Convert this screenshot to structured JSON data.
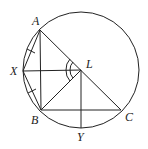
{
  "diagram": {
    "type": "geometry",
    "circle": {
      "cx": 81,
      "cy": 70,
      "r": 58,
      "color": "#222222"
    },
    "points": {
      "A": {
        "label": "A",
        "x": 40,
        "y": 30
      },
      "X": {
        "label": "X",
        "x": 23,
        "y": 71
      },
      "L": {
        "label": "L",
        "x": 81,
        "y": 70
      },
      "B": {
        "label": "B",
        "x": 41,
        "y": 110
      },
      "C": {
        "label": "C",
        "x": 121,
        "y": 110
      },
      "Y": {
        "label": "Y",
        "x": 81,
        "y": 128
      }
    },
    "segments": [
      "AX",
      "XB",
      "AB",
      "AC",
      "XL",
      "BL",
      "BC",
      "LY"
    ],
    "tick_marks": [
      "AX",
      "XB"
    ],
    "angle_marks": [
      {
        "at": "L",
        "between": [
          "A",
          "X"
        ],
        "arcs": 2
      },
      {
        "at": "L",
        "between": [
          "X",
          "B"
        ],
        "arcs": 2
      }
    ]
  }
}
